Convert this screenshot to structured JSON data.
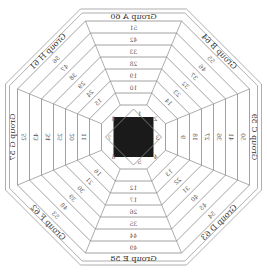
{
  "diagram": {
    "mirrored": true,
    "center_fill": "#1a1a1a",
    "line_color": "#8a8a8a",
    "groups": [
      {
        "name": "Group A",
        "side": "top",
        "outer": 60,
        "values": [
          51,
          42,
          33,
          28,
          19,
          10
        ]
      },
      {
        "name": "Group B",
        "side": "top-right",
        "outer": 64,
        "values": [
          55,
          46,
          37,
          32,
          23,
          14
        ]
      },
      {
        "name": "Group C",
        "side": "right",
        "outer": 59,
        "values": [
          50,
          41,
          36,
          27,
          18,
          9
        ]
      },
      {
        "name": "Group D",
        "side": "bottom-right",
        "outer": 63,
        "values": [
          54,
          45,
          40,
          31,
          22,
          13
        ]
      },
      {
        "name": "Group E",
        "side": "bottom",
        "outer": 58,
        "values": [
          49,
          44,
          35,
          26,
          17,
          12
        ]
      },
      {
        "name": "Group F",
        "side": "bottom-left",
        "outer": 62,
        "values": [
          53,
          48,
          39,
          30,
          21,
          16
        ]
      },
      {
        "name": "Group G",
        "side": "left",
        "outer": 57,
        "values": [
          52,
          43,
          34,
          25,
          20,
          11
        ]
      },
      {
        "name": "Group H",
        "side": "top-left",
        "outer": 61,
        "values": [
          56,
          47,
          38,
          29,
          24,
          15
        ]
      }
    ],
    "center_labels": [
      "1",
      "2",
      "3",
      "4",
      "5",
      "6",
      "7",
      "8"
    ]
  }
}
